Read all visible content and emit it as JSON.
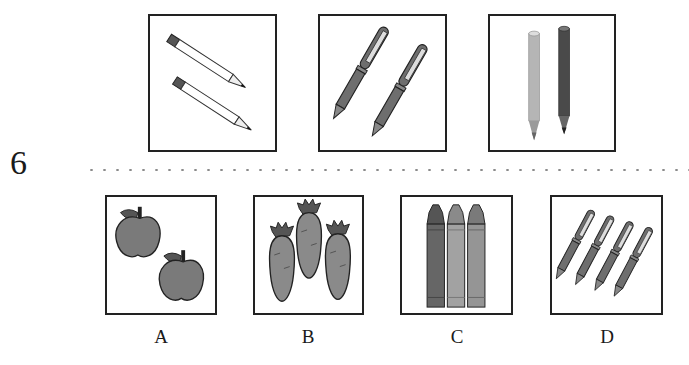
{
  "question": {
    "number": "6",
    "prompt_items": [
      {
        "name": "pencils",
        "count": 2,
        "icon": "pencil-icon"
      },
      {
        "name": "pens",
        "count": 2,
        "icon": "pen-icon"
      },
      {
        "name": "colored-pencils",
        "count": 2,
        "icon": "colored-pencil-icon"
      }
    ],
    "options": [
      {
        "label": "A",
        "name": "apples",
        "count": 2,
        "icon": "apple-icon"
      },
      {
        "label": "B",
        "name": "carrots",
        "count": 3,
        "icon": "carrot-icon"
      },
      {
        "label": "C",
        "name": "crayons",
        "count": 3,
        "icon": "crayon-icon"
      },
      {
        "label": "D",
        "name": "pens",
        "count": 4,
        "icon": "pen-icon"
      }
    ]
  },
  "colors": {
    "border": "#222222",
    "fill_dark": "#555555",
    "fill_mid": "#7a7a7a",
    "fill_light": "#a8a8a8",
    "divider": "#8a8a8a"
  }
}
